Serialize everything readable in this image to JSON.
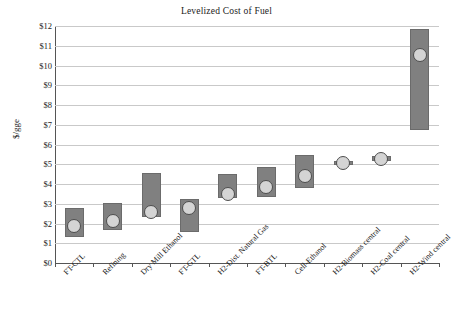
{
  "chart_data": {
    "type": "bar",
    "title": "Levelized Cost of Fuel",
    "xlabel": "",
    "ylabel": "$/gge",
    "ylim": [
      0,
      12
    ],
    "ytick_step": 1,
    "ytick_labels": [
      "$12",
      "$11",
      "$10",
      "$9",
      "$8",
      "$7",
      "$6",
      "$5",
      "$4",
      "$3",
      "$2",
      "$1",
      "$0"
    ],
    "grid": true,
    "legend": "none",
    "bar_style": "floating range bar (low to high) with central-estimate circle marker",
    "categories": [
      "FT-CTL",
      "Refining",
      "Dry Mill Ethanol",
      "FT-GTL",
      "H2-Dist. Natural Gas",
      "FT-BTL",
      "Cell-Ethanol",
      "H2-Biomass central",
      "H2-Coal central",
      "H2-Wind central"
    ],
    "series": [
      {
        "name": "Range low",
        "values": [
          1.3,
          1.68,
          2.35,
          1.55,
          3.3,
          3.33,
          3.82,
          4.95,
          5.17,
          6.75
        ]
      },
      {
        "name": "Range high",
        "values": [
          2.8,
          3.03,
          4.55,
          3.25,
          4.52,
          4.85,
          5.45,
          5.18,
          5.4,
          11.85
        ]
      },
      {
        "name": "Central estimate",
        "values": [
          1.85,
          2.13,
          2.58,
          2.78,
          3.48,
          3.85,
          4.43,
          5.06,
          5.28,
          10.52
        ]
      }
    ],
    "colors": {
      "bar_fill": "#808080",
      "bar_edge": "#6b6b6b",
      "marker_fill": "#d4d4d4",
      "marker_edge": "#4d4d4d",
      "gridline": "#c9c9c9",
      "axis": "#555555",
      "text": "#1a1a1a",
      "background": "#ffffff"
    }
  }
}
